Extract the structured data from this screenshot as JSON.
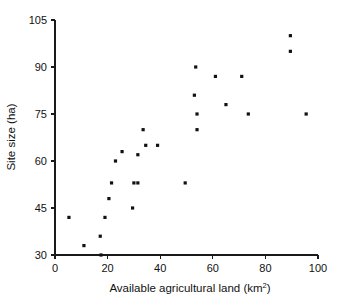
{
  "chart_data": {
    "type": "scatter",
    "title": "",
    "xlabel": "Available agricultural land (km²)",
    "xlabel_base": "Available agricultural land (km",
    "xlabel_sup": "2",
    "xlabel_tail": ")",
    "ylabel": "Site size (ha)",
    "xlim": [
      0,
      100
    ],
    "ylim": [
      30,
      105
    ],
    "xticks": [
      0,
      20,
      40,
      60,
      80,
      100
    ],
    "xtick_labels": [
      "0",
      "20",
      "40",
      "60",
      "80",
      "100"
    ],
    "yticks": [
      30,
      45,
      60,
      75,
      90,
      105
    ],
    "ytick_labels": [
      "30",
      "45",
      "60",
      "75",
      "90",
      "105"
    ],
    "grid": false,
    "legend": false,
    "marker": "square",
    "marker_color": "#111111",
    "marker_size_px": 3.2,
    "points": [
      {
        "x": 5.3,
        "y": 42
      },
      {
        "x": 11.0,
        "y": 33
      },
      {
        "x": 17.2,
        "y": 36
      },
      {
        "x": 17.5,
        "y": 30
      },
      {
        "x": 19.0,
        "y": 42
      },
      {
        "x": 20.5,
        "y": 48
      },
      {
        "x": 21.5,
        "y": 53
      },
      {
        "x": 23.0,
        "y": 60
      },
      {
        "x": 25.5,
        "y": 63
      },
      {
        "x": 29.5,
        "y": 45
      },
      {
        "x": 30.0,
        "y": 53
      },
      {
        "x": 31.5,
        "y": 53
      },
      {
        "x": 31.5,
        "y": 62
      },
      {
        "x": 33.5,
        "y": 70
      },
      {
        "x": 34.5,
        "y": 65
      },
      {
        "x": 39.0,
        "y": 65
      },
      {
        "x": 49.5,
        "y": 53
      },
      {
        "x": 53.0,
        "y": 81
      },
      {
        "x": 53.5,
        "y": 90
      },
      {
        "x": 54.0,
        "y": 75
      },
      {
        "x": 54.0,
        "y": 70
      },
      {
        "x": 61.0,
        "y": 87
      },
      {
        "x": 65.0,
        "y": 78
      },
      {
        "x": 71.0,
        "y": 87
      },
      {
        "x": 73.5,
        "y": 75
      },
      {
        "x": 89.5,
        "y": 100
      },
      {
        "x": 89.5,
        "y": 95
      },
      {
        "x": 95.5,
        "y": 75
      }
    ]
  },
  "axes": {
    "x_axis_name": "x-axis",
    "y_axis_name": "y-axis"
  }
}
